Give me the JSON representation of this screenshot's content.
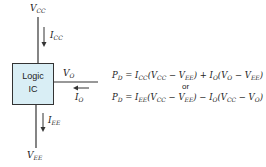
{
  "diagram": {
    "box": {
      "line1": "Logic",
      "line2": "IC",
      "fill": "#d9eef5"
    },
    "labels": {
      "vcc": {
        "main": "V",
        "sub": "CC"
      },
      "icc": {
        "main": "I",
        "sub": "CC"
      },
      "vo": {
        "main": "V",
        "sub": "O"
      },
      "io": {
        "main": "I",
        "sub": "O"
      },
      "iee": {
        "main": "I",
        "sub": "EE"
      },
      "vee": {
        "main": "V",
        "sub": "EE"
      }
    },
    "equations": {
      "eq1": "P_D = I_CC(V_CC − V_EE) + I_O(V_O − V_EE)",
      "or": "or",
      "eq2": "P_D = I_EE(V_CC − V_EE) − I_O(V_CC − V_O)"
    }
  }
}
